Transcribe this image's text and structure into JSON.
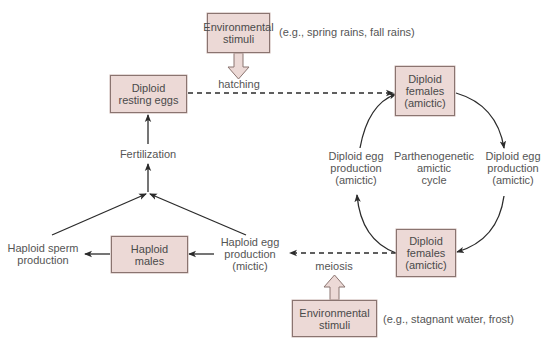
{
  "colors": {
    "box_fill": "#ecd9d6",
    "box_border": "#8a7470",
    "arrow": "#2b2b2b",
    "text": "#555555"
  },
  "nodes": {
    "env_stimuli_top": {
      "line1": "Environmental",
      "line2": "stimuli"
    },
    "env_stimuli_top_example": "(e.g., spring rains, fall rains)",
    "hatching": "hatching",
    "resting_eggs": {
      "line1": "Diploid",
      "line2": "resting eggs"
    },
    "females_top": {
      "line1": "Diploid",
      "line2": "females",
      "line3": "(amictic)"
    },
    "fertilization": "Fertilization",
    "egg_prod_left": {
      "line1": "Diploid egg",
      "line2": "production",
      "line3": "(amictic)"
    },
    "cycle_label": {
      "line1": "Parthenogenetic",
      "line2": "amictic",
      "line3": "cycle"
    },
    "egg_prod_right": {
      "line1": "Diploid egg",
      "line2": "production",
      "line3": "(amictic)"
    },
    "sperm_prod": {
      "line1": "Haploid sperm",
      "line2": "production"
    },
    "males": {
      "line1": "Haploid",
      "line2": "males"
    },
    "haploid_egg_prod": {
      "line1": "Haploid egg",
      "line2": "production",
      "line3": "(mictic)"
    },
    "meiosis": "meiosis",
    "females_bottom": {
      "line1": "Diploid",
      "line2": "females",
      "line3": "(amictic)"
    },
    "env_stimuli_bottom": {
      "line1": "Environmental",
      "line2": "stimuli"
    },
    "env_stimuli_bottom_example": "(e.g., stagnant water, frost)"
  }
}
